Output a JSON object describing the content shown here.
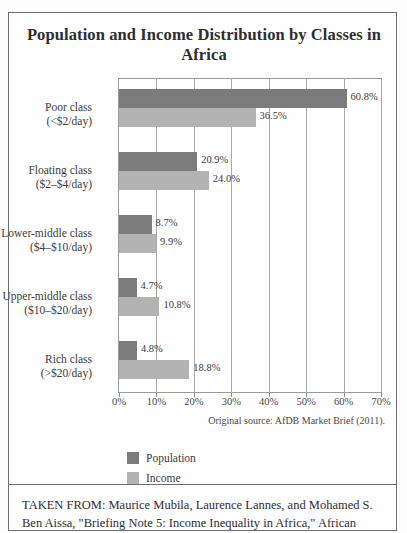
{
  "figure": {
    "title": "Population and Income Distribution by Classes in Africa",
    "source_note": "Original source: AfDB Market Brief (2011).",
    "caption": "TAKEN FROM: Maurice Mubila, Laurence Lannes, and Mohamed S. Ben Aissa, \"Briefing Note 5: Income Inequality in Africa,\" African"
  },
  "legend": {
    "items": [
      {
        "label": "Population",
        "color": "#7b7b7b",
        "swatch": "population"
      },
      {
        "label": "Income",
        "color": "#b3b3b3",
        "swatch": "income"
      }
    ]
  },
  "chart_data": {
    "type": "bar",
    "orientation": "horizontal",
    "title": "Population and Income Distribution by Classes in Africa",
    "xlabel": "",
    "ylabel": "",
    "xlim": [
      0,
      70
    ],
    "xticks": [
      "0%",
      "10%",
      "20%",
      "30%",
      "40%",
      "50%",
      "60%",
      "70%"
    ],
    "xtick_values": [
      0,
      10,
      20,
      30,
      40,
      50,
      60,
      70
    ],
    "grid": true,
    "legend_position": "below-left",
    "categories": [
      {
        "name": "Poor class",
        "range": "(<$2/day)"
      },
      {
        "name": "Floating class",
        "range": "($2–$4/day)"
      },
      {
        "name": "Lower-middle class",
        "range": "($4–$10/day)"
      },
      {
        "name": "Upper-middle class",
        "range": "($10–$20/day)"
      },
      {
        "name": "Rich class",
        "range": "(>$20/day)"
      }
    ],
    "series": [
      {
        "name": "Population",
        "color": "#7b7b7b",
        "values": [
          60.8,
          20.9,
          8.7,
          4.7,
          4.8
        ],
        "labels": [
          "60.8%",
          "20.9%",
          "8.7%",
          "4.7%",
          "4.8%"
        ]
      },
      {
        "name": "Income",
        "color": "#b3b3b3",
        "values": [
          36.5,
          24.0,
          9.9,
          10.8,
          18.8
        ],
        "labels": [
          "36.5%",
          "24.0%",
          "9.9%",
          "10.8%",
          "18.8%"
        ]
      }
    ]
  }
}
